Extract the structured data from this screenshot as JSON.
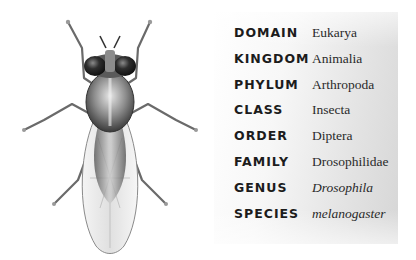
{
  "illustration": {
    "subject": "fruit fly (Drosophila melanogaster), dorsal view",
    "icon": "fly-illustration"
  },
  "taxonomy": [
    {
      "rank": "DOMAIN",
      "value": "Eukarya",
      "italic": false
    },
    {
      "rank": "KINGDOM",
      "value": "Animalia",
      "italic": false
    },
    {
      "rank": "PHYLUM",
      "value": "Arthropoda",
      "italic": false
    },
    {
      "rank": "CLASS",
      "value": "Insecta",
      "italic": false
    },
    {
      "rank": "ORDER",
      "value": "Diptera",
      "italic": false
    },
    {
      "rank": "FAMILY",
      "value": "Drosophilidae",
      "italic": false
    },
    {
      "rank": "GENUS",
      "value": "Drosophila",
      "italic": true
    },
    {
      "rank": "SPECIES",
      "value": "melanogaster",
      "italic": true
    }
  ],
  "colors": {
    "label": "#1c1c1c",
    "value": "#2a2a2a",
    "panel_light": "#ffffff",
    "panel_dark": "#d6d6d6"
  }
}
